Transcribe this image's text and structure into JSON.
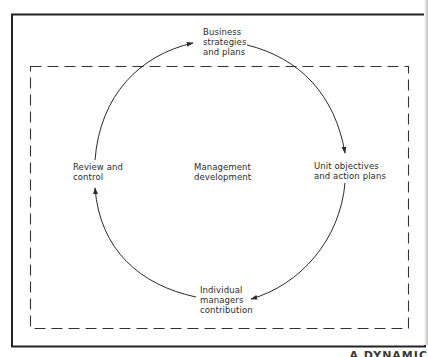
{
  "diagram": {
    "type": "cycle",
    "center_label": "Management\ndevelopment",
    "nodes": [
      {
        "id": "business-strategies",
        "label": "Business\nstrategies\nand plans",
        "position": "top"
      },
      {
        "id": "unit-objectives",
        "label": "Unit objectives\nand action plans",
        "position": "right"
      },
      {
        "id": "individual-managers",
        "label": "Individual\nmanagers\ncontribution",
        "position": "bottom"
      },
      {
        "id": "review-control",
        "label": "Review and\ncontrol",
        "position": "left"
      }
    ],
    "flow": [
      {
        "from": "business-strategies",
        "to": "unit-objectives",
        "direction": "clockwise"
      },
      {
        "from": "unit-objectives",
        "to": "individual-managers",
        "direction": "clockwise"
      },
      {
        "from": "individual-managers",
        "to": "review-control",
        "direction": "clockwise"
      },
      {
        "from": "review-control",
        "to": "business-strategies",
        "direction": "clockwise"
      }
    ],
    "frames": {
      "outer": "solid",
      "inner": "dashed"
    },
    "caption_fragment": "A DYNAMIC"
  },
  "colors": {
    "ink": "#2a2a2a",
    "background": "#ffffff"
  }
}
